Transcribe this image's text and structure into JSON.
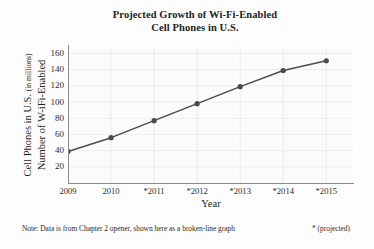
{
  "chart_data": {
    "type": "line",
    "title": "Projected Growth of Wi-Fi-Enabled Cell Phones in U.S.",
    "title_line1": "Projected Growth of Wi-Fi-Enabled",
    "title_line2": "Cell Phones in U.S.",
    "xlabel": "Year",
    "ylabel": "Number of W-iFi-Enabled Cell Phones in U.S. (in millions)",
    "ylabel_line1": "Number of W-iFi-Enabled",
    "ylabel_line2_main": "Cell Phones in U.S.",
    "ylabel_line2_small": "(in millions)",
    "categories": [
      "2009",
      "2010",
      "*2011",
      "*2012",
      "*2013",
      "*2014",
      "*2015"
    ],
    "values": [
      39,
      56,
      77,
      98,
      119,
      139,
      151
    ],
    "yticks": [
      20,
      40,
      60,
      80,
      100,
      120,
      140,
      160
    ],
    "ylim": [
      0,
      168
    ],
    "xlim": [
      0,
      6
    ],
    "grid": "both-light",
    "legend": "none",
    "series_color": "#4a4a52",
    "marker_color": "#4a4a52",
    "marker": "circle",
    "notes": {
      "note_text": "Note: Data is from Chapter 2 opener, shown here as a broken-line graph",
      "key_text": "* (projected)"
    }
  },
  "colors": {
    "background": "#fdfdfd",
    "plot_background": "#fbfbfb",
    "axis": "#8a8a8a",
    "grid": "#e9e9e9",
    "text": "#2b2b2b",
    "title": "#1e1e1e",
    "line": "#4a4a52"
  }
}
